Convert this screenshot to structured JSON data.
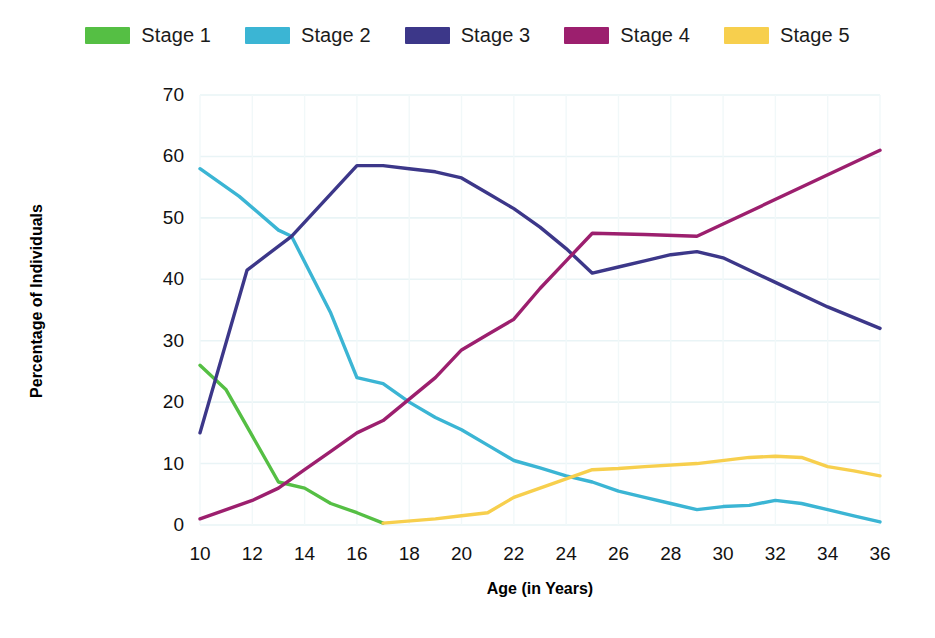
{
  "legend": {
    "position": "top",
    "items": [
      {
        "label": "Stage 1",
        "color": "#55bf44",
        "swatch_name": "legend-swatch-stage-1"
      },
      {
        "label": "Stage 2",
        "color": "#3bb5d4",
        "swatch_name": "legend-swatch-stage-2"
      },
      {
        "label": "Stage 3",
        "color": "#3c3789",
        "swatch_name": "legend-swatch-stage-3"
      },
      {
        "label": "Stage 4",
        "color": "#9c1f6e",
        "swatch_name": "legend-swatch-stage-4"
      },
      {
        "label": "Stage 5",
        "color": "#f7cf4d",
        "swatch_name": "legend-swatch-stage-5"
      }
    ]
  },
  "axes": {
    "x_title": "Age (in Years)",
    "y_title": "Percentage of Individuals",
    "x_ticks": [
      "10",
      "12",
      "14",
      "16",
      "18",
      "20",
      "22",
      "24",
      "26",
      "28",
      "30",
      "32",
      "34",
      "36"
    ],
    "y_ticks": [
      "0",
      "10",
      "20",
      "30",
      "40",
      "50",
      "60",
      "70"
    ]
  },
  "chart_data": {
    "type": "line",
    "title": "",
    "subtitle": "",
    "xlabel": "Age (in Years)",
    "ylabel": "Percentage of Individuals",
    "xlim": [
      10,
      36
    ],
    "ylim": [
      0,
      70
    ],
    "x_tick_step": 2,
    "y_tick_step": 10,
    "grid": true,
    "grid_color": "#e9f4f6",
    "legend_position": "top",
    "background": "#ffffff",
    "series": [
      {
        "name": "Stage 1",
        "color": "#55bf44",
        "points": [
          [
            10,
            26.0
          ],
          [
            11,
            22.0
          ],
          [
            12,
            14.5
          ],
          [
            13,
            7.0
          ],
          [
            14,
            6.0
          ],
          [
            15,
            3.5
          ],
          [
            16,
            2.0
          ],
          [
            17,
            0.3
          ]
        ]
      },
      {
        "name": "Stage 2",
        "color": "#3bb5d4",
        "points": [
          [
            10,
            58.0
          ],
          [
            11.5,
            53.5
          ],
          [
            13.0,
            48.0
          ],
          [
            13.5,
            47.0
          ],
          [
            15,
            34.5
          ],
          [
            16,
            24.0
          ],
          [
            17,
            23.0
          ],
          [
            18,
            20.0
          ],
          [
            19,
            17.5
          ],
          [
            20,
            15.5
          ],
          [
            21,
            13.0
          ],
          [
            22,
            10.5
          ],
          [
            23,
            9.3
          ],
          [
            24,
            8.0
          ],
          [
            25,
            7.0
          ],
          [
            26,
            5.5
          ],
          [
            27,
            4.5
          ],
          [
            28,
            3.5
          ],
          [
            29,
            2.5
          ],
          [
            30,
            3.0
          ],
          [
            31,
            3.2
          ],
          [
            32,
            4.0
          ],
          [
            33,
            3.5
          ],
          [
            34,
            2.5
          ],
          [
            35,
            1.5
          ],
          [
            36,
            0.5
          ]
        ]
      },
      {
        "name": "Stage 3",
        "color": "#3c3789",
        "points": [
          [
            10,
            15.0
          ],
          [
            11.8,
            41.5
          ],
          [
            13.5,
            47.0
          ],
          [
            16,
            58.5
          ],
          [
            17,
            58.5
          ],
          [
            18,
            58.0
          ],
          [
            19,
            57.5
          ],
          [
            20,
            56.5
          ],
          [
            21,
            54.0
          ],
          [
            22,
            51.5
          ],
          [
            23,
            48.5
          ],
          [
            24,
            45.0
          ],
          [
            25,
            41.0
          ],
          [
            26,
            42.0
          ],
          [
            27,
            43.0
          ],
          [
            28,
            44.0
          ],
          [
            29,
            44.5
          ],
          [
            30,
            43.5
          ],
          [
            32,
            39.5
          ],
          [
            34,
            35.5
          ],
          [
            36,
            32.0
          ]
        ]
      },
      {
        "name": "Stage 4",
        "color": "#9c1f6e",
        "points": [
          [
            10,
            1.0
          ],
          [
            12,
            4.0
          ],
          [
            13,
            6.0
          ],
          [
            14,
            9.0
          ],
          [
            15,
            12.0
          ],
          [
            16,
            15.0
          ],
          [
            17,
            17.0
          ],
          [
            18,
            20.5
          ],
          [
            19,
            24.0
          ],
          [
            20,
            28.5
          ],
          [
            21,
            31.0
          ],
          [
            22,
            33.5
          ],
          [
            23,
            38.5
          ],
          [
            24,
            43.0
          ],
          [
            25,
            47.5
          ],
          [
            27,
            47.3
          ],
          [
            29,
            47.0
          ],
          [
            36,
            61.0
          ]
        ]
      },
      {
        "name": "Stage 5",
        "color": "#f7cf4d",
        "points": [
          [
            17,
            0.3
          ],
          [
            19,
            1.0
          ],
          [
            20,
            1.5
          ],
          [
            21,
            2.0
          ],
          [
            22,
            4.5
          ],
          [
            23,
            6.0
          ],
          [
            24,
            7.5
          ],
          [
            25,
            9.0
          ],
          [
            26,
            9.2
          ],
          [
            27,
            9.5
          ],
          [
            29,
            10.0
          ],
          [
            31,
            11.0
          ],
          [
            32,
            11.2
          ],
          [
            33,
            11.0
          ],
          [
            34,
            9.5
          ],
          [
            35,
            8.8
          ],
          [
            36,
            8.0
          ]
        ]
      }
    ]
  }
}
